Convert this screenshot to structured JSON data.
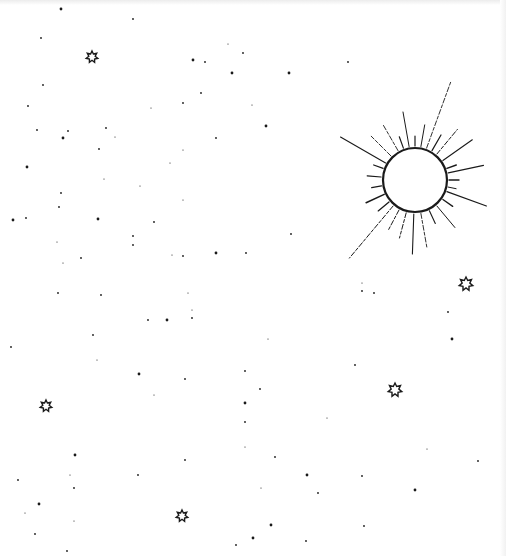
{
  "scene": {
    "description": "Hand-drawn night sky sketch: sun with rays, outlined stars and scattered dots",
    "colors": {
      "background": "#ffffff",
      "ink": "#1a1a1a"
    }
  },
  "sun": {
    "cx": 415,
    "cy": 180,
    "r": 32
  },
  "stars": [
    {
      "x": 92,
      "y": 57,
      "size": 6
    },
    {
      "x": 466,
      "y": 284,
      "size": 7
    },
    {
      "x": 395,
      "y": 390,
      "size": 7
    },
    {
      "x": 46,
      "y": 406,
      "size": 6
    },
    {
      "x": 182,
      "y": 516,
      "size": 6
    }
  ],
  "dots": [
    [
      61,
      9
    ],
    [
      133,
      19
    ],
    [
      41,
      38
    ],
    [
      228,
      44
    ],
    [
      243,
      53
    ],
    [
      193,
      60
    ],
    [
      151,
      108
    ],
    [
      201,
      93
    ],
    [
      183,
      103
    ],
    [
      252,
      105
    ],
    [
      266,
      126
    ],
    [
      37,
      130
    ],
    [
      115,
      137
    ],
    [
      68,
      131
    ],
    [
      106,
      128
    ],
    [
      232,
      73
    ],
    [
      205,
      62
    ],
    [
      28,
      106
    ],
    [
      140,
      186
    ],
    [
      43,
      85
    ],
    [
      27,
      167
    ],
    [
      183,
      150
    ],
    [
      216,
      138
    ],
    [
      99,
      149
    ],
    [
      170,
      163
    ],
    [
      63,
      138
    ],
    [
      61,
      193
    ],
    [
      104,
      179
    ],
    [
      26,
      218
    ],
    [
      59,
      207
    ],
    [
      98,
      219
    ],
    [
      133,
      236
    ],
    [
      154,
      222
    ],
    [
      183,
      200
    ],
    [
      183,
      256
    ],
    [
      13,
      220
    ],
    [
      57,
      242
    ],
    [
      81,
      258
    ],
    [
      133,
      245
    ],
    [
      172,
      255
    ],
    [
      216,
      253
    ],
    [
      246,
      253
    ],
    [
      63,
      263
    ],
    [
      291,
      234
    ],
    [
      348,
      62
    ],
    [
      289,
      73
    ],
    [
      58,
      293
    ],
    [
      101,
      295
    ],
    [
      188,
      293
    ],
    [
      148,
      320
    ],
    [
      167,
      320
    ],
    [
      192,
      310
    ],
    [
      192,
      318
    ],
    [
      93,
      335
    ],
    [
      97,
      360
    ],
    [
      139,
      374
    ],
    [
      185,
      379
    ],
    [
      154,
      395
    ],
    [
      11,
      347
    ],
    [
      245,
      371
    ],
    [
      245,
      403
    ],
    [
      185,
      460
    ],
    [
      245,
      422
    ],
    [
      245,
      447
    ],
    [
      138,
      475
    ],
    [
      75,
      455
    ],
    [
      70,
      475
    ],
    [
      74,
      488
    ],
    [
      18,
      480
    ],
    [
      25,
      513
    ],
    [
      39,
      504
    ],
    [
      35,
      534
    ],
    [
      74,
      521
    ],
    [
      67,
      551
    ],
    [
      236,
      545
    ],
    [
      253,
      538
    ],
    [
      362,
      291
    ],
    [
      374,
      293
    ],
    [
      362,
      283
    ],
    [
      448,
      312
    ],
    [
      452,
      339
    ],
    [
      268,
      339
    ],
    [
      355,
      365
    ],
    [
      260,
      389
    ],
    [
      327,
      418
    ],
    [
      307,
      475
    ],
    [
      362,
      476
    ],
    [
      427,
      449
    ],
    [
      478,
      461
    ],
    [
      318,
      493
    ],
    [
      415,
      490
    ],
    [
      306,
      541
    ],
    [
      364,
      526
    ],
    [
      261,
      488
    ],
    [
      275,
      457
    ],
    [
      271,
      525
    ]
  ]
}
